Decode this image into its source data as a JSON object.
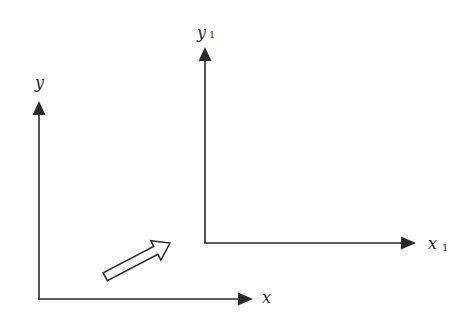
{
  "diagram": {
    "original_axes": {
      "x_label": "x",
      "y_label": "y"
    },
    "translated_axes": {
      "x_label": "x",
      "x_subscript": "1",
      "y_label": "y",
      "y_subscript": "1"
    },
    "translation_arrow": "hollow-arrow",
    "colors": {
      "stroke": "#2a2a2a",
      "background": "#ffffff"
    }
  }
}
